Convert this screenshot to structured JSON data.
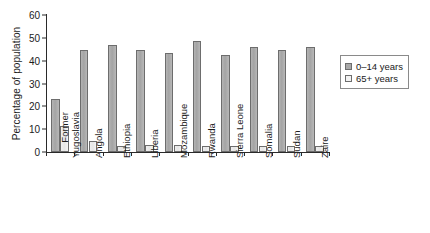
{
  "chart_data": {
    "type": "bar",
    "title": "",
    "xlabel": "",
    "ylabel": "Percentage of population",
    "ylim": [
      0,
      60
    ],
    "yticks": [
      0,
      10,
      20,
      30,
      40,
      50,
      60
    ],
    "grid": false,
    "legend_position": "right",
    "categories": [
      "Former Yugoslavia",
      "Angola",
      "Ethiopia",
      "Liberia",
      "Mozambique",
      "Rwanda",
      "Sierra Leone",
      "Somalia",
      "Sudan",
      "Zaire"
    ],
    "category_lines": [
      [
        "Former",
        "Yugoslavia"
      ],
      [
        "Angola"
      ],
      [
        "Ethiopia"
      ],
      [
        "Liberia"
      ],
      [
        "Mozambique"
      ],
      [
        "Rwanda"
      ],
      [
        "Sierra Leone"
      ],
      [
        "Somalia"
      ],
      [
        "Sudan"
      ],
      [
        "Zaire"
      ]
    ],
    "series": [
      {
        "name": "0–14 years",
        "color": "#a8a8a8",
        "values": [
          23,
          44.5,
          47,
          44.5,
          43.5,
          48.5,
          42.5,
          46,
          44.5,
          46
        ]
      },
      {
        "name": "65+ years",
        "color": "#f2f2f2",
        "values": [
          11.5,
          5,
          2.5,
          3,
          3,
          2.5,
          2.5,
          2.5,
          2.5,
          2.5
        ]
      }
    ]
  },
  "legend": {
    "items": [
      {
        "label": "0–14 years"
      },
      {
        "label": "65+ years"
      }
    ]
  },
  "colors": {
    "axis": "#2a2a2a",
    "bar_young": "#a8a8a8",
    "bar_old": "#f2f2f2",
    "bar_outline": "#6d6d6d",
    "background": "#ffffff"
  }
}
